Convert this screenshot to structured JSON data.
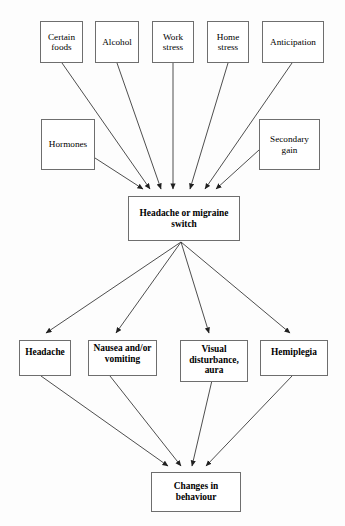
{
  "diagram": {
    "type": "flowchart",
    "title_cropped": "",
    "background_color": "#fdfdfd",
    "box_border_color": "#6e6e6e",
    "line_color": "#3a3a3a",
    "text_color": "#000000",
    "rows": {
      "triggers_top": [
        "Certain foods",
        "Alcohol",
        "Work stress",
        "Home stress",
        "Anticipation"
      ],
      "triggers_side": [
        "Hormones",
        "Secondary gain"
      ],
      "switch": "Headache or migraine switch",
      "symptoms": [
        "Headache",
        "Nausea and/or vomiting",
        "Visual disturbance, aura",
        "Hemiplegia"
      ],
      "outcome": "Changes in behaviour"
    },
    "nodes": {
      "certain_foods": {
        "label_line1": "Certain",
        "label_line2": "foods"
      },
      "alcohol": {
        "label_line1": "Alcohol",
        "label_line2": ""
      },
      "work_stress": {
        "label_line1": "Work",
        "label_line2": "stress"
      },
      "home_stress": {
        "label_line1": "Home",
        "label_line2": "stress"
      },
      "anticipation": {
        "label_line1": "Anticipation",
        "label_line2": ""
      },
      "hormones": {
        "label_line1": "Hormones",
        "label_line2": ""
      },
      "secondary_gain": {
        "label_line1": "Secondary",
        "label_line2": "gain"
      },
      "switch": {
        "label_line1": "Headache or migraine",
        "label_line2": "switch"
      },
      "headache": {
        "label_line1": "Headache",
        "label_line2": ""
      },
      "nausea": {
        "label_line1": "Nausea and/or",
        "label_line2": "vomiting"
      },
      "visual": {
        "label_line1": "Visual",
        "label_line2": "disturbance,",
        "label_line3": "aura"
      },
      "hemiplegia": {
        "label_line1": "Hemiplegia",
        "label_line2": ""
      },
      "changes": {
        "label_line1": "Changes in",
        "label_line2": "behaviour"
      }
    },
    "edges": [
      {
        "from": "Certain foods",
        "to": "Headache or migraine switch"
      },
      {
        "from": "Alcohol",
        "to": "Headache or migraine switch"
      },
      {
        "from": "Work stress",
        "to": "Headache or migraine switch"
      },
      {
        "from": "Home stress",
        "to": "Headache or migraine switch"
      },
      {
        "from": "Anticipation",
        "to": "Headache or migraine switch"
      },
      {
        "from": "Hormones",
        "to": "Headache or migraine switch"
      },
      {
        "from": "Secondary gain",
        "to": "Headache or migraine switch"
      },
      {
        "from": "Headache or migraine switch",
        "to": "Headache"
      },
      {
        "from": "Headache or migraine switch",
        "to": "Nausea and/or vomiting"
      },
      {
        "from": "Headache or migraine switch",
        "to": "Visual disturbance, aura"
      },
      {
        "from": "Headache or migraine switch",
        "to": "Hemiplegia"
      },
      {
        "from": "Headache",
        "to": "Changes in behaviour"
      },
      {
        "from": "Nausea and/or vomiting",
        "to": "Changes in behaviour"
      },
      {
        "from": "Visual disturbance, aura",
        "to": "Changes in behaviour"
      },
      {
        "from": "Hemiplegia",
        "to": "Changes in behaviour"
      }
    ]
  }
}
